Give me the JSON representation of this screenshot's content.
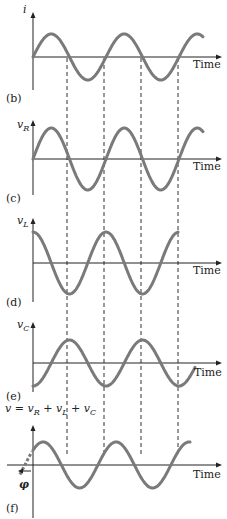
{
  "figure": {
    "x_axis_label": "Time",
    "colors": {
      "wave": "#7a7a7a",
      "axis": "#222222",
      "dash": "#333333"
    },
    "period_px": 73,
    "dashed_lines_x": [
      67,
      104,
      141,
      178
    ],
    "phase_label": "φ"
  },
  "panels": [
    {
      "id": "b",
      "label": "(b)",
      "y_label_main": "i",
      "y_label_sub": "",
      "quantity": "current i",
      "waveform": "sine",
      "phase_deg": 0,
      "baseline_y": 57,
      "amplitude_px": 23
    },
    {
      "id": "c",
      "label": "(c)",
      "y_label_main": "v",
      "y_label_sub": "R",
      "quantity": "resistor voltage vR (in phase with i)",
      "waveform": "sine",
      "phase_deg": 0,
      "baseline_y": 159,
      "amplitude_px": 31
    },
    {
      "id": "d",
      "label": "(d)",
      "y_label_main": "v",
      "y_label_sub": "L",
      "quantity": "inductor voltage vL (leads i by 90°)",
      "waveform": "cosine",
      "phase_deg": 90,
      "baseline_y": 263,
      "amplitude_px": 31
    },
    {
      "id": "e",
      "label": "(e)",
      "y_label_main": "v",
      "y_label_sub": "C",
      "quantity": "capacitor voltage vC (lags i by 90°)",
      "waveform": "-cosine",
      "phase_deg": -90,
      "baseline_y": 363,
      "amplitude_px": 23
    },
    {
      "id": "f",
      "label": "(f)",
      "y_label_main": "v = v",
      "y_label_sub": "R",
      "y_label_extra": "+ vL + vC",
      "quantity": "total voltage v = vR + vL + vC (leads i by φ)",
      "waveform": "sine",
      "phase_deg": 40,
      "baseline_y": 465,
      "amplitude_px": 23
    }
  ],
  "equation_f": {
    "v": "v",
    "eq": " = ",
    "vR": "v",
    "R": "R",
    "plus1": " + ",
    "vL": "v",
    "L": "L",
    "plus2": " + ",
    "vC": "v",
    "C": "C"
  }
}
